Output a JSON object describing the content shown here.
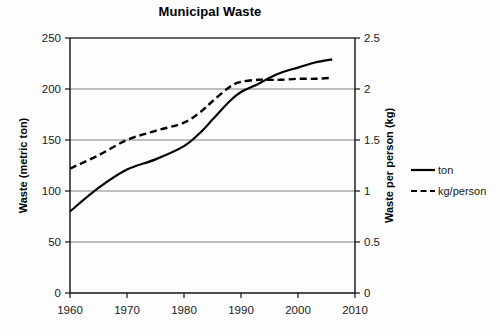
{
  "chart_data": {
    "type": "line",
    "title": "Municipal Waste",
    "xlabel": "",
    "ylabel": "Waste (metric ton)",
    "y2label": "Waste per person (kg)",
    "xlim": [
      1960,
      2010
    ],
    "ylim": [
      0,
      250
    ],
    "y2lim": [
      0,
      2.5
    ],
    "xticks": [
      "1960",
      "1970",
      "1980",
      "1990",
      "2000",
      "2010"
    ],
    "xtick_values": [
      1960,
      1970,
      1980,
      1990,
      2000,
      2010
    ],
    "yticks": [
      "0",
      "50",
      "100",
      "150",
      "200",
      "250"
    ],
    "ytick_values": [
      0,
      50,
      100,
      150,
      200,
      250
    ],
    "y2ticks": [
      "0",
      "0.5",
      "1",
      "1.5",
      "2",
      "2.5"
    ],
    "y2tick_values": [
      0,
      0.5,
      1,
      1.5,
      2,
      2.5
    ],
    "grid": "horizontal",
    "legend_position": "right",
    "series": [
      {
        "name": "ton",
        "axis": "left",
        "style": "solid",
        "color": "#000000",
        "x": [
          1960,
          1965,
          1970,
          1975,
          1980,
          1983,
          1985,
          1988,
          1990,
          1993,
          1995,
          1997,
          2000,
          2003,
          2006
        ],
        "values": [
          80,
          103,
          121,
          131,
          144,
          158,
          170,
          188,
          197,
          205,
          211,
          216,
          221,
          226,
          229
        ]
      },
      {
        "name": "kg/person",
        "axis": "right",
        "style": "dashed",
        "color": "#000000",
        "x": [
          1960,
          1965,
          1970,
          1975,
          1980,
          1983,
          1985,
          1988,
          1990,
          1993,
          1995,
          1997,
          2000,
          2003,
          2006
        ],
        "values": [
          1.22,
          1.35,
          1.5,
          1.59,
          1.67,
          1.78,
          1.88,
          2.02,
          2.07,
          2.09,
          2.09,
          2.09,
          2.1,
          2.1,
          2.11
        ]
      }
    ]
  },
  "legend": {
    "items": [
      {
        "label": "ton",
        "style": "solid"
      },
      {
        "label": "kg/person",
        "style": "dashed"
      }
    ]
  }
}
